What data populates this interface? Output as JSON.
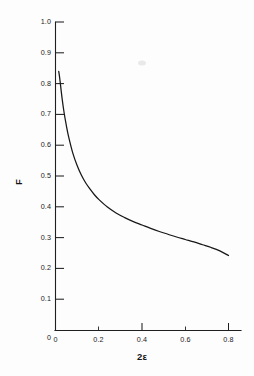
{
  "figure": {
    "background_color": "#fdfdfd",
    "line_color": "#171717",
    "axis_color": "#1f1f1f"
  },
  "chart_data": {
    "type": "line",
    "title": "",
    "subtitle": "",
    "xlabel": "2ε",
    "ylabel": "F",
    "xlim": [
      0,
      0.88
    ],
    "ylim": [
      0,
      1.0
    ],
    "grid": false,
    "legend": "none",
    "x_ticks_major": [
      0,
      0.2,
      0.4,
      0.6,
      0.8
    ],
    "x_tick_labels": [
      "0",
      "0.2",
      "0.4",
      "0.6",
      "0.8"
    ],
    "x_ticks_minor": [
      0.1,
      0.3,
      0.5,
      0.7
    ],
    "y_ticks_major": [
      0,
      0.1,
      0.2,
      0.3,
      0.4,
      0.5,
      0.6,
      0.7,
      0.8,
      0.9,
      1.0
    ],
    "y_tick_labels": [
      "0",
      "0.1",
      "0.2",
      "0.3",
      "0.4",
      "0.5",
      "0.6",
      "0.7",
      "0.8",
      "0.9",
      "1.0"
    ],
    "series": [
      {
        "name": "F",
        "x": [
          0.015,
          0.02,
          0.03,
          0.04,
          0.05,
          0.06,
          0.08,
          0.1,
          0.12,
          0.14,
          0.16,
          0.18,
          0.2,
          0.24,
          0.28,
          0.32,
          0.36,
          0.4,
          0.44,
          0.48,
          0.52,
          0.56,
          0.6,
          0.64,
          0.68,
          0.72,
          0.76,
          0.8
        ],
        "y": [
          0.84,
          0.815,
          0.755,
          0.705,
          0.665,
          0.63,
          0.575,
          0.535,
          0.503,
          0.478,
          0.458,
          0.44,
          0.425,
          0.4,
          0.381,
          0.366,
          0.353,
          0.342,
          0.331,
          0.321,
          0.312,
          0.303,
          0.295,
          0.287,
          0.278,
          0.269,
          0.258,
          0.243
        ]
      }
    ],
    "annotations": []
  }
}
